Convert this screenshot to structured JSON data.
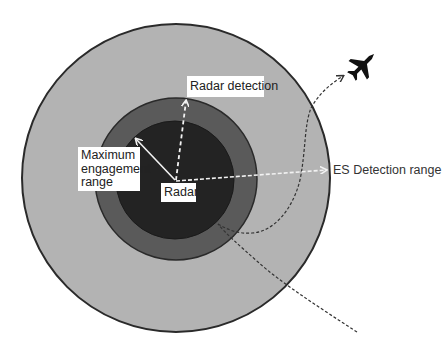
{
  "diagram": {
    "colors": {
      "background": "#ffffff",
      "outer_zone": "#b3b3b3",
      "middle_zone": "#5a5a5a",
      "inner_zone": "#232323",
      "outline": "#2a2a2a",
      "white_arrow": "#f2f2f2",
      "flight_path": "#333333"
    },
    "zones": [
      {
        "name": "ES detection range zone",
        "cx": 176,
        "cy": 178,
        "r": 155
      },
      {
        "name": "Radar detection zone",
        "cx": 176,
        "cy": 179,
        "r": 81
      },
      {
        "name": "Maximum engagement zone",
        "cx": 175,
        "cy": 180,
        "r": 59
      }
    ],
    "labels": {
      "radar": "Radar",
      "radar_detection": "Radar detection",
      "max_engagement_line1": "Maximum",
      "max_engagement_line2": "engagement",
      "max_engagement_line3": "range",
      "es_detection": "ES Detection range"
    },
    "icons": {
      "aircraft": "fighter-jet-icon"
    }
  }
}
